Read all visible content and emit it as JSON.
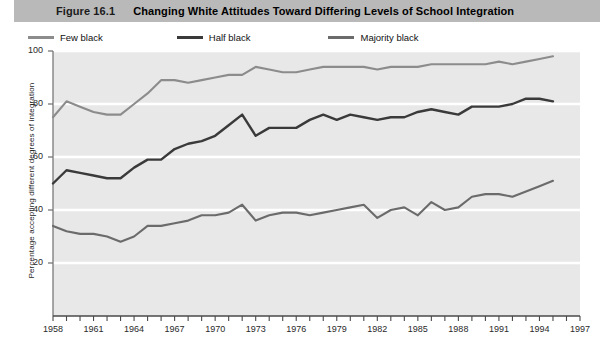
{
  "figure": {
    "number": "Figure 16.1",
    "title": "Changing White Attitudes Toward Differing Levels of School Integration"
  },
  "colors": {
    "title_bar": "#b9b9b9",
    "plot_background": "#e8e8e8",
    "gridline": "#ffffff",
    "axis": "#6e6e6e",
    "few_black": "#8c8c8c",
    "half_black": "#3a3a3a",
    "majority_black": "#6b6b6b"
  },
  "chart_data": {
    "type": "line",
    "title": "Changing White Attitudes Toward Differing Levels of School Integration",
    "xlabel": "",
    "ylabel": "Percentage accepting different degrees of integration",
    "xlim": [
      1958,
      1997
    ],
    "ylim": [
      0,
      100
    ],
    "grid": true,
    "legend_position": "top-left",
    "yticks": [
      20,
      40,
      60,
      80,
      100
    ],
    "xticks": [
      1958,
      1959,
      1960,
      1961,
      1962,
      1963,
      1964,
      1965,
      1966,
      1967,
      1968,
      1969,
      1970,
      1971,
      1972,
      1973,
      1974,
      1975,
      1976,
      1977,
      1978,
      1979,
      1980,
      1981,
      1982,
      1983,
      1984,
      1985,
      1986,
      1987,
      1988,
      1989,
      1990,
      1991,
      1992,
      1993,
      1994,
      1995,
      1996,
      1997
    ],
    "xtick_labels": [
      1958,
      1961,
      1964,
      1967,
      1970,
      1973,
      1976,
      1979,
      1982,
      1985,
      1988,
      1991,
      1994,
      1997
    ],
    "x": [
      1958,
      1959,
      1960,
      1961,
      1962,
      1963,
      1964,
      1965,
      1966,
      1967,
      1968,
      1969,
      1970,
      1971,
      1972,
      1973,
      1974,
      1975,
      1976,
      1977,
      1978,
      1979,
      1980,
      1981,
      1982,
      1983,
      1984,
      1985,
      1986,
      1987,
      1988,
      1989,
      1990,
      1991,
      1992,
      1993,
      1994,
      1995
    ],
    "series": [
      {
        "name": "Few black",
        "color": "#8c8c8c",
        "values": [
          75,
          81,
          79,
          77,
          76,
          76,
          80,
          84,
          89,
          89,
          88,
          89,
          90,
          91,
          91,
          94,
          93,
          92,
          92,
          93,
          94,
          94,
          94,
          94,
          93,
          94,
          94,
          94,
          95,
          95,
          95,
          95,
          95,
          96,
          95,
          96,
          97,
          98
        ]
      },
      {
        "name": "Half black",
        "color": "#3a3a3a",
        "values": [
          50,
          55,
          54,
          53,
          52,
          52,
          56,
          59,
          59,
          63,
          65,
          66,
          68,
          72,
          76,
          68,
          71,
          71,
          71,
          74,
          76,
          74,
          76,
          75,
          74,
          75,
          75,
          77,
          78,
          77,
          76,
          79,
          79,
          79,
          80,
          82,
          82,
          81
        ]
      },
      {
        "name": "Majority black",
        "color": "#6b6b6b",
        "values": [
          34,
          32,
          31,
          31,
          30,
          28,
          30,
          34,
          34,
          35,
          36,
          38,
          38,
          39,
          42,
          36,
          38,
          39,
          39,
          38,
          39,
          40,
          41,
          42,
          37,
          40,
          41,
          38,
          43,
          40,
          41,
          45,
          46,
          46,
          45,
          47,
          49,
          51
        ]
      }
    ]
  }
}
